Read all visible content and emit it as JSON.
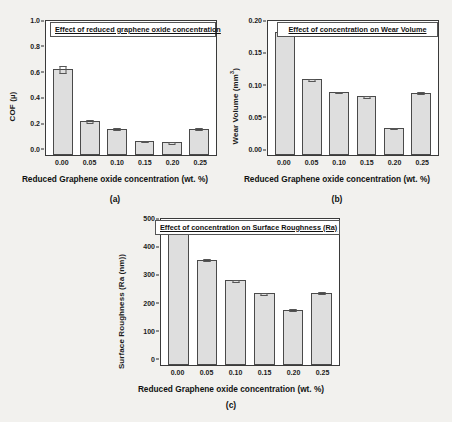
{
  "figure": {
    "background": "#f2f1ee",
    "bar_fill": "#dedede",
    "bar_stroke": "#4a4a4a"
  },
  "panels": [
    {
      "id": "a",
      "caption": "(a)",
      "title": "Effect of reduced graphene oxide concentration",
      "ylabel": "COF (µ)",
      "ylabel_sup": "",
      "xlabel": "Reduced Graphene oxide concentration (wt. %)",
      "yticks": [
        "1.0",
        "0.8",
        "0.6",
        "0.4",
        "0.2",
        "0.0"
      ],
      "xticks": [
        "0.00",
        "0.05",
        "0.10",
        "0.15",
        "0.20",
        "0.25"
      ]
    },
    {
      "id": "b",
      "caption": "(b)",
      "title": "Effect of concentration on Wear Volume",
      "ylabel": "Wear Volume (mm",
      "ylabel_sup": "3",
      "xlabel": "Reduced Graphene oxide concentration (wt. %)",
      "yticks": [
        "0.20",
        "0.15",
        "0.10",
        "0.05",
        "0.00"
      ],
      "xticks": [
        "0.00",
        "0.05",
        "0.10",
        "0.15",
        "0.20",
        "0.25"
      ]
    },
    {
      "id": "c",
      "caption": "(c)",
      "title": "Effect of concentration on Surface Roughness (Ra)",
      "ylabel": "Surface Roughness (Ra (nm))",
      "ylabel_sup": "",
      "xlabel": "Reduced Graphene oxide concentration (wt. %)",
      "yticks": [
        "500",
        "400",
        "300",
        "200",
        "100",
        "0"
      ],
      "xticks": [
        "0.00",
        "0.05",
        "0.10",
        "0.15",
        "0.20",
        "0.25"
      ]
    }
  ],
  "chart_data": [
    {
      "type": "bar",
      "panel": "a",
      "title": "Effect of reduced graphene oxide concentration",
      "xlabel": "Reduced Graphene oxide concentration (wt. %)",
      "ylabel": "COF (µ)",
      "categories": [
        "0.00",
        "0.05",
        "0.10",
        "0.15",
        "0.20",
        "0.25"
      ],
      "values": [
        0.64,
        0.255,
        0.195,
        0.107,
        0.094,
        0.197
      ],
      "errors": [
        0.028,
        0.012,
        0.011,
        0.008,
        0.007,
        0.011
      ],
      "ylim": [
        0.0,
        1.0
      ],
      "ytick_step": 0.2,
      "grid": false,
      "legend": "none"
    },
    {
      "type": "bar",
      "panel": "b",
      "title": "Effect of concentration on Wear Volume",
      "xlabel": "Reduced Graphene oxide concentration (wt. %)",
      "ylabel": "Wear Volume (mm3)",
      "categories": [
        "0.00",
        "0.05",
        "0.10",
        "0.15",
        "0.20",
        "0.25"
      ],
      "values": [
        0.195,
        0.12,
        0.1,
        0.093,
        0.043,
        0.099
      ],
      "errors": [
        0.004,
        0.002,
        0.002,
        0.002,
        0.002,
        0.002
      ],
      "ylim": [
        0.0,
        0.2125
      ],
      "ytick_step": 0.05,
      "grid": false,
      "legend": "none"
    },
    {
      "type": "bar",
      "panel": "c",
      "title": "Effect of concentration on Surface Roughness (Ra)",
      "xlabel": "Reduced Graphene oxide concentration (wt. %)",
      "ylabel": "Surface Roughness (Ra (nm))",
      "categories": [
        "0.00",
        "0.05",
        "0.10",
        "0.15",
        "0.20",
        "0.25"
      ],
      "values": [
        498,
        375,
        302,
        256,
        197,
        258
      ],
      "errors": [
        6,
        5,
        5,
        5,
        5,
        5
      ],
      "ylim": [
        0,
        520
      ],
      "ytick_step": 100,
      "grid": false,
      "legend": "none"
    }
  ]
}
